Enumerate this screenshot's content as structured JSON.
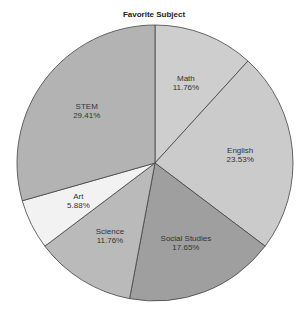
{
  "chart_data": {
    "type": "pie",
    "title": "Favorite Subject",
    "start_angle": "12 o'clock, clockwise",
    "slices": [
      {
        "label": "Math",
        "value": 11.76,
        "pct_label": "11.76%",
        "color": "#cecece"
      },
      {
        "label": "English",
        "value": 23.53,
        "pct_label": "23.53%",
        "color": "#cbcbcb"
      },
      {
        "label": "Social Studies",
        "value": 17.65,
        "pct_label": "17.65%",
        "color": "#9f9f9f"
      },
      {
        "label": "Science",
        "value": 11.76,
        "pct_label": "11.76%",
        "color": "#bababa"
      },
      {
        "label": "Art",
        "value": 5.88,
        "pct_label": "5.88%",
        "color": "#f2f2f2"
      },
      {
        "label": "STEM",
        "value": 29.41,
        "pct_label": "29.41%",
        "color": "#b3b3b3"
      }
    ],
    "legend": "none"
  }
}
